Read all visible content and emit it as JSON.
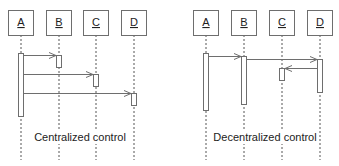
{
  "diagrams": [
    {
      "name": "centralized",
      "caption": "Centralized control",
      "lifelines": [
        {
          "label": "A",
          "x": 21
        },
        {
          "label": "B",
          "x": 59
        },
        {
          "label": "C",
          "x": 96
        },
        {
          "label": "D",
          "x": 134
        }
      ],
      "messages": [
        {
          "from": "A",
          "to": "B",
          "y": 55
        },
        {
          "from": "A",
          "to": "C",
          "y": 74
        },
        {
          "from": "A",
          "to": "D",
          "y": 93
        }
      ]
    },
    {
      "name": "decentralized",
      "caption": "Decentralized control",
      "lifelines": [
        {
          "label": "A",
          "x": 206
        },
        {
          "label": "B",
          "x": 244
        },
        {
          "label": "C",
          "x": 282
        },
        {
          "label": "D",
          "x": 320
        }
      ],
      "messages": [
        {
          "from": "A",
          "to": "B",
          "y": 56
        },
        {
          "from": "B",
          "to": "D",
          "y": 59
        },
        {
          "from": "D",
          "to": "C",
          "y": 68
        }
      ]
    }
  ],
  "colors": {
    "stroke": "#6e6e6e",
    "text": "#222222",
    "background": "#ffffff"
  }
}
